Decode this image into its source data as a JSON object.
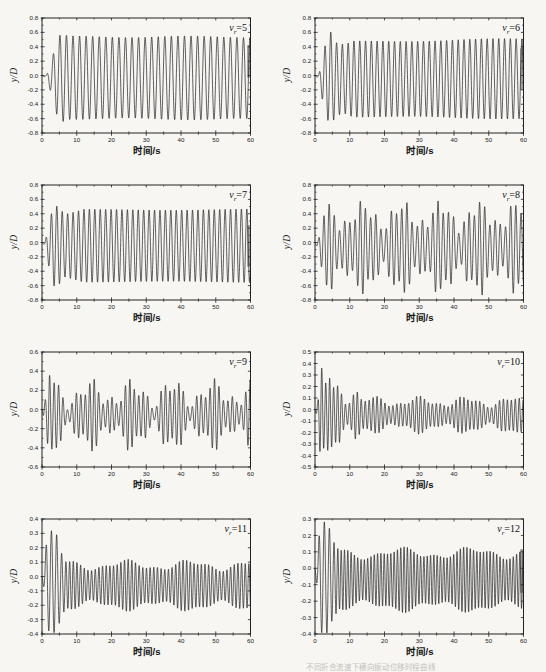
{
  "colors": {
    "page_bg": "#f7f6f3",
    "frame": "#222222",
    "trace": "#1c1c1c",
    "tick_text": "#1a1a1a",
    "caption": "#857f74"
  },
  "caption": {
    "text": "不同折合流速下横向振动位移时程曲线"
  },
  "chart_data": [
    {
      "type": "line",
      "title": "vr=5",
      "label": {
        "var": "v",
        "sub": "r",
        "eq": "=5"
      },
      "xlabel": "时间/s",
      "ylabel": "y/D",
      "xlim": [
        0,
        60
      ],
      "xticks": [
        0,
        10,
        20,
        30,
        40,
        50,
        60
      ],
      "xminor_step": 5,
      "ylim": [
        -0.8,
        0.8
      ],
      "ytick_step": 0.2,
      "yminor_step": 0.1,
      "grid": false,
      "legend": "inside-top-right",
      "signal": {
        "freq": 0.53,
        "phase_deg": 180,
        "mean": [
          [
            0,
            0
          ],
          [
            2.5,
            -0.03
          ],
          [
            60,
            -0.035
          ]
        ],
        "envelope": [
          [
            0,
            0
          ],
          [
            1.3,
            0.02
          ],
          [
            2.8,
            0.24
          ],
          [
            4.2,
            0.5
          ],
          [
            5.5,
            0.61
          ],
          [
            7.5,
            0.57
          ],
          [
            60,
            0.575
          ]
        ],
        "am": [
          {
            "freq": 0.03,
            "depth": 0.02,
            "phase_deg": 0
          }
        ]
      },
      "scan_smear": [
        45,
        78
      ]
    },
    {
      "type": "line",
      "title": "vr=6",
      "label": {
        "var": "v",
        "sub": "r",
        "eq": "=6"
      },
      "xlabel": "时间/s",
      "ylabel": "y/D",
      "xlim": [
        0,
        60
      ],
      "xticks": [
        0,
        10,
        20,
        30,
        40,
        50,
        60
      ],
      "xminor_step": 5,
      "ylim": [
        -0.8,
        0.8
      ],
      "ytick_step": 0.2,
      "yminor_step": 0.1,
      "grid": false,
      "legend": "inside-top-right",
      "signal": {
        "freq": 0.6,
        "phase_deg": 180,
        "mean": [
          [
            0,
            0
          ],
          [
            2.5,
            -0.05
          ],
          [
            60,
            -0.045
          ]
        ],
        "envelope": [
          [
            0,
            0
          ],
          [
            1.1,
            0.03
          ],
          [
            2.6,
            0.42
          ],
          [
            4.4,
            0.66
          ],
          [
            6,
            0.5
          ],
          [
            8.5,
            0.47
          ],
          [
            11,
            0.52
          ],
          [
            60,
            0.555
          ]
        ],
        "am": [
          {
            "freq": 0.025,
            "depth": 0.02,
            "phase_deg": 0
          }
        ]
      },
      "scan_smear": [
        48,
        90
      ]
    },
    {
      "type": "line",
      "title": "vr=7",
      "label": {
        "var": "v",
        "sub": "r",
        "eq": "=7"
      },
      "xlabel": "时间/s",
      "ylabel": "y/D",
      "xlim": [
        0,
        60
      ],
      "xticks": [
        0,
        10,
        20,
        30,
        40,
        50,
        60
      ],
      "xminor_step": 5,
      "ylim": [
        -0.8,
        0.8
      ],
      "ytick_step": 0.2,
      "yminor_step": 0.1,
      "grid": false,
      "legend": "inside-top-right",
      "signal": {
        "freq": 0.64,
        "phase_deg": 180,
        "mean": [
          [
            0,
            0
          ],
          [
            2,
            -0.045
          ],
          [
            60,
            -0.045
          ]
        ],
        "envelope": [
          [
            0,
            0
          ],
          [
            0.9,
            0.03
          ],
          [
            2.1,
            0.32
          ],
          [
            3.3,
            0.56
          ],
          [
            4.8,
            0.54
          ],
          [
            6.5,
            0.43
          ],
          [
            9,
            0.46
          ],
          [
            12,
            0.5
          ],
          [
            60,
            0.505
          ]
        ],
        "am": [
          {
            "freq": 0.02,
            "depth": 0.015,
            "phase_deg": 0
          }
        ]
      },
      "scan_smear": [
        58,
        100
      ]
    },
    {
      "type": "line",
      "title": "vr=8",
      "label": {
        "var": "v",
        "sub": "r",
        "eq": "=8"
      },
      "xlabel": "时间/s",
      "ylabel": "y/D",
      "xlim": [
        0,
        60
      ],
      "xticks": [
        0,
        10,
        20,
        30,
        40,
        50,
        60
      ],
      "xminor_step": 5,
      "ylim": [
        -0.8,
        0.8
      ],
      "ytick_step": 0.2,
      "yminor_step": 0.1,
      "grid": false,
      "legend": "inside-top-right",
      "signal": {
        "freq": 0.67,
        "phase_deg": 180,
        "mean": [
          [
            0,
            0
          ],
          [
            2,
            -0.07
          ],
          [
            60,
            -0.07
          ]
        ],
        "envelope": [
          [
            0,
            0
          ],
          [
            1,
            0.06
          ],
          [
            2.6,
            0.4
          ],
          [
            4,
            0.43
          ],
          [
            60,
            0.44
          ]
        ],
        "am": [
          {
            "freq": 0.09,
            "depth": 0.33,
            "phase_deg": 0
          },
          {
            "freq": 0.23,
            "depth": 0.22,
            "phase_deg": 70
          }
        ]
      },
      "scan_smear": null
    },
    {
      "type": "line",
      "title": "vr=9",
      "label": {
        "var": "v",
        "sub": "r",
        "eq": "=9"
      },
      "xlabel": "时间/s",
      "ylabel": "y/D",
      "xlim": [
        0,
        60
      ],
      "xticks": [
        0,
        10,
        20,
        30,
        40,
        50,
        60
      ],
      "xminor_step": 5,
      "ylim": [
        -0.6,
        0.6
      ],
      "ytick_step": 0.2,
      "yminor_step": 0.1,
      "grid": false,
      "legend": "inside-top-right",
      "signal": {
        "freq": 0.78,
        "phase_deg": 180,
        "mean": [
          [
            0,
            0
          ],
          [
            2,
            -0.06
          ],
          [
            60,
            -0.055
          ]
        ],
        "envelope": [
          [
            0,
            0
          ],
          [
            1,
            0.1
          ],
          [
            2.1,
            0.38
          ],
          [
            3.2,
            0.27
          ],
          [
            4.5,
            0.22
          ],
          [
            60,
            0.215
          ]
        ],
        "am": [
          {
            "freq": 0.085,
            "depth": 0.45,
            "phase_deg": 20
          },
          {
            "freq": 0.2,
            "depth": 0.33,
            "phase_deg": 100
          }
        ]
      },
      "scan_smear": null
    },
    {
      "type": "line",
      "title": "vr=10",
      "label": {
        "var": "v",
        "sub": "r",
        "eq": "=10"
      },
      "xlabel": "时间/s",
      "ylabel": "y/D",
      "xlim": [
        0,
        60
      ],
      "xticks": [
        0,
        10,
        20,
        30,
        40,
        50,
        60
      ],
      "xminor_step": 5,
      "ylim": [
        -0.5,
        0.5
      ],
      "ytick_step": 0.1,
      "yminor_step": null,
      "grid": false,
      "legend": "inside-top-right",
      "signal": {
        "freq": 0.88,
        "phase_deg": 180,
        "mean": [
          [
            0,
            0
          ],
          [
            2,
            -0.045
          ],
          [
            60,
            -0.05
          ]
        ],
        "envelope": [
          [
            0,
            0
          ],
          [
            0.8,
            0.06
          ],
          [
            1.7,
            0.36
          ],
          [
            2.7,
            0.22
          ],
          [
            4,
            0.29
          ],
          [
            5.5,
            0.18
          ],
          [
            7,
            0.23
          ],
          [
            9,
            0.14
          ],
          [
            11.5,
            0.24
          ],
          [
            13.5,
            0.115
          ],
          [
            60,
            0.115
          ]
        ],
        "am": [
          {
            "freq": 0.075,
            "depth": 0.3,
            "phase_deg": 0
          },
          {
            "freq": 0.17,
            "depth": 0.16,
            "phase_deg": 60
          }
        ]
      },
      "scan_smear": null
    },
    {
      "type": "line",
      "title": "vr=11",
      "label": {
        "var": "v",
        "sub": "r",
        "eq": "=11"
      },
      "xlabel": "时间/s",
      "ylabel": "y/D",
      "xlim": [
        0,
        60
      ],
      "xticks": [
        0,
        10,
        20,
        30,
        40,
        50,
        60
      ],
      "xminor_step": 5,
      "ylim": [
        -0.4,
        0.4
      ],
      "ytick_step": 0.1,
      "yminor_step": null,
      "grid": false,
      "legend": "inside-top-right",
      "signal": {
        "freq": [
          [
            0,
            0.62
          ],
          [
            5,
            0.68
          ],
          [
            7.5,
            0.95
          ],
          [
            60,
            0.95
          ]
        ],
        "phase_deg": 180,
        "mean": [
          [
            0,
            0
          ],
          [
            1.2,
            -0.025
          ],
          [
            6,
            -0.06
          ],
          [
            60,
            -0.065
          ]
        ],
        "envelope": [
          [
            0,
            0
          ],
          [
            0.7,
            0.1
          ],
          [
            1.5,
            0.31
          ],
          [
            4.2,
            0.3
          ],
          [
            5.8,
            0.19
          ],
          [
            7,
            0.14
          ],
          [
            60,
            0.142
          ]
        ],
        "am": [
          {
            "freq": 0.055,
            "depth": 0.2,
            "phase_deg": -30
          },
          {
            "freq": 0.13,
            "depth": 0.1,
            "phase_deg": 0
          }
        ]
      },
      "scan_smear": null
    },
    {
      "type": "line",
      "title": "vr=12",
      "label": {
        "var": "v",
        "sub": "r",
        "eq": "=12"
      },
      "xlabel": "时间/s",
      "ylabel": "y/D",
      "xlim": [
        0,
        60
      ],
      "xticks": [
        0,
        10,
        20,
        30,
        40,
        50,
        60
      ],
      "xminor_step": 5,
      "ylim": [
        -0.4,
        0.3
      ],
      "ytick_step": 0.1,
      "yminor_step": null,
      "grid": false,
      "legend": "inside-top-right",
      "signal": {
        "freq": [
          [
            0,
            0.62
          ],
          [
            4.5,
            0.7
          ],
          [
            7,
            1.05
          ],
          [
            60,
            1.05
          ]
        ],
        "phase_deg": 180,
        "mean": [
          [
            0,
            0
          ],
          [
            1.2,
            -0.05
          ],
          [
            6,
            -0.07
          ],
          [
            60,
            -0.07
          ]
        ],
        "envelope": [
          [
            0,
            0
          ],
          [
            0.7,
            0.1
          ],
          [
            1.5,
            0.29
          ],
          [
            3.8,
            0.3
          ],
          [
            5.2,
            0.22
          ],
          [
            7,
            0.16
          ],
          [
            60,
            0.165
          ]
        ],
        "am": [
          {
            "freq": 0.05,
            "depth": 0.16,
            "phase_deg": 0
          },
          {
            "freq": 0.12,
            "depth": 0.09,
            "phase_deg": 45
          }
        ]
      },
      "scan_smear": [
        48,
        92
      ]
    }
  ]
}
